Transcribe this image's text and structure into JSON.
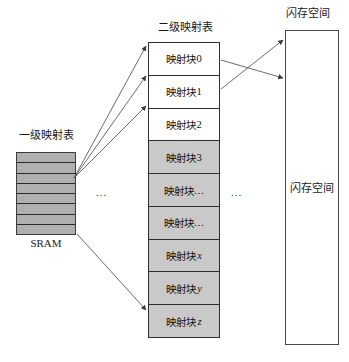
{
  "diagram": {
    "title_level1": "一级映射表",
    "caption_sram": "SRAM",
    "title_level2": "二级映射表",
    "title_flash": "闪存空间",
    "flash_inner_label": "闪存空间",
    "ellipsis_left": "...",
    "ellipsis_right": "...",
    "colors": {
      "shaded_cell": "#c9c9c9",
      "sram_fill": "#b0b0b0",
      "border": "#2e2e2e",
      "arrow": "#4a4a4a",
      "background": "#ffffff"
    },
    "level1_table": {
      "row_count": 8,
      "rows": [
        "",
        "",
        "",
        "",
        "",
        "",
        "",
        ""
      ]
    },
    "level2_table": {
      "cells": [
        {
          "label": "映射块 0",
          "prefix": "映射块 ",
          "suffix": "0",
          "italic_suffix": false,
          "shaded": false
        },
        {
          "label": "映射块 1",
          "prefix": "映射块 ",
          "suffix": "1",
          "italic_suffix": false,
          "shaded": false
        },
        {
          "label": "映射块 2",
          "prefix": "映射块 ",
          "suffix": "2",
          "italic_suffix": false,
          "shaded": false
        },
        {
          "label": "映射块 3",
          "prefix": "映射块 ",
          "suffix": "3",
          "italic_suffix": false,
          "shaded": true
        },
        {
          "label": "映射块…",
          "prefix": "映射块",
          "suffix": "…",
          "italic_suffix": false,
          "shaded": true
        },
        {
          "label": "映射块…",
          "prefix": "映射块",
          "suffix": "…",
          "italic_suffix": false,
          "shaded": true
        },
        {
          "label": "映射块 x",
          "prefix": "映射块 ",
          "suffix": "x",
          "italic_suffix": true,
          "shaded": true
        },
        {
          "label": "映射块 y",
          "prefix": "映射块 ",
          "suffix": "y",
          "italic_suffix": true,
          "shaded": true
        },
        {
          "label": "映射块 z",
          "prefix": "映射块 ",
          "suffix": "z",
          "italic_suffix": true,
          "shaded": true
        }
      ]
    },
    "arrows": [
      {
        "name": "sram-to-block-0",
        "from": [
          74,
          178
        ],
        "to": [
          147,
          45
        ]
      },
      {
        "name": "sram-to-block-1",
        "from": [
          74,
          178
        ],
        "to": [
          147,
          75
        ]
      },
      {
        "name": "sram-to-block-2",
        "from": [
          74,
          178
        ],
        "to": [
          147,
          105
        ]
      },
      {
        "name": "sram-to-block-z",
        "from": [
          76,
          234
        ],
        "to": [
          146,
          310
        ]
      },
      {
        "name": "block-0-to-flash-lower",
        "from": [
          221,
          60
        ],
        "to": [
          284,
          77
        ]
      },
      {
        "name": "block-1-to-flash-upper",
        "from": [
          221,
          89
        ],
        "to": [
          284,
          40
        ]
      }
    ]
  }
}
